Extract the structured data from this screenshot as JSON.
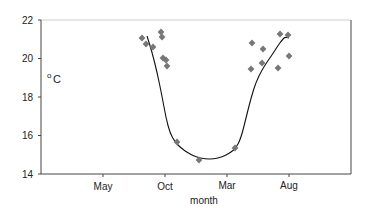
{
  "chart_data": {
    "type": "scatter",
    "title": "",
    "xlabel": "month",
    "ylabel": "oC",
    "ylim": [
      14,
      22
    ],
    "yticks": [
      14,
      16,
      18,
      20,
      22
    ],
    "xticks": [
      "May",
      "Oct",
      "Mar",
      "Aug"
    ],
    "grid": false,
    "legend": null,
    "series": [
      {
        "name": "observations",
        "kind": "scatter",
        "marker": "diamond",
        "color": "#777777",
        "points_px": [
          [
            142,
            38
          ],
          [
            146,
            44
          ],
          [
            153,
            47
          ],
          [
            161,
            32
          ],
          [
            162,
            37
          ],
          [
            163,
            58
          ],
          [
            166,
            60
          ],
          [
            167,
            66
          ],
          [
            177,
            142
          ],
          [
            199,
            160
          ],
          [
            235,
            148
          ],
          [
            251,
            69
          ],
          [
            252,
            43
          ],
          [
            262,
            63
          ],
          [
            263,
            49
          ],
          [
            278,
            68
          ],
          [
            280,
            34
          ],
          [
            288,
            35
          ],
          [
            289,
            56
          ]
        ],
        "values": [
          {
            "x": "Sep",
            "y": 21.0
          },
          {
            "x": "Sep",
            "y": 20.7
          },
          {
            "x": "Sep",
            "y": 20.6
          },
          {
            "x": "Oct",
            "y": 21.4
          },
          {
            "x": "Oct",
            "y": 21.1
          },
          {
            "x": "Oct",
            "y": 20.0
          },
          {
            "x": "Oct",
            "y": 19.9
          },
          {
            "x": "Oct",
            "y": 19.6
          },
          {
            "x": "Nov",
            "y": 15.7
          },
          {
            "x": "Jan",
            "y": 14.7
          },
          {
            "x": "Mar",
            "y": 15.3
          },
          {
            "x": "Jun",
            "y": 18.1
          },
          {
            "x": "Jun",
            "y": 19.4
          },
          {
            "x": "Jun",
            "y": 18.7
          },
          {
            "x": "Jun",
            "y": 19.8
          },
          {
            "x": "Jul",
            "y": 19.5
          },
          {
            "x": "Jul",
            "y": 21.2
          },
          {
            "x": "Aug",
            "y": 21.3
          },
          {
            "x": "Aug",
            "y": 20.1
          }
        ]
      },
      {
        "name": "fitted curve",
        "kind": "line",
        "color": "#111111",
        "path_px": [
          [
            147,
            36
          ],
          [
            152,
            52
          ],
          [
            157,
            72
          ],
          [
            162,
            96
          ],
          [
            166,
            118
          ],
          [
            170,
            133
          ],
          [
            175,
            142
          ],
          [
            181,
            148
          ],
          [
            188,
            153
          ],
          [
            196,
            157
          ],
          [
            205,
            159
          ],
          [
            214,
            159
          ],
          [
            222,
            157
          ],
          [
            230,
            153
          ],
          [
            236,
            148
          ],
          [
            241,
            138
          ],
          [
            246,
            118
          ],
          [
            251,
            98
          ],
          [
            256,
            82
          ],
          [
            262,
            70
          ],
          [
            267,
            62
          ],
          [
            272,
            55
          ],
          [
            277,
            47
          ],
          [
            282,
            40
          ],
          [
            285,
            37
          ],
          [
            289,
            38
          ]
        ]
      }
    ]
  },
  "axes": {
    "y_tick_labels": [
      "22",
      "20",
      "18",
      "16",
      "14"
    ],
    "x_tick_labels": [
      "May",
      "Oct",
      "Mar",
      "Aug"
    ],
    "x_title": "month",
    "y_unit_sup": "o",
    "y_unit": "C"
  }
}
